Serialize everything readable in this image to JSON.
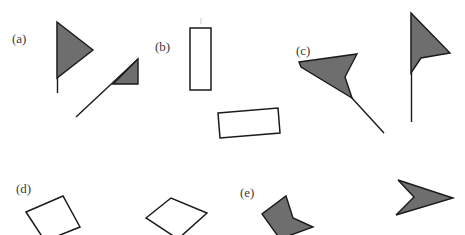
{
  "figure": {
    "background_color": "#ffffff",
    "fill_color": "#6e6e6e",
    "stroke_color": "#1a1a1a",
    "label_color": "#3b3b3b",
    "width": 465,
    "height": 235
  },
  "panels": [
    {
      "id": "a",
      "label": "(a)",
      "label_x": 12,
      "label_y": 32,
      "shapes": [
        {
          "name": "flag-with-triangle-pennant",
          "type": "filled-polygon-with-pole",
          "points": "57,22 93,50 57,78",
          "pole": "57,22 57,93"
        },
        {
          "name": "diagonal-line-with-right-triangle",
          "type": "filled-polygon-with-line",
          "points": "113,84 138,84 138,59",
          "line": "76,117 138,59"
        }
      ]
    },
    {
      "id": "b",
      "label": "(b)",
      "label_x": 155,
      "label_y": 40,
      "shapes": [
        {
          "name": "vertical-rectangle-outline",
          "type": "outline-polygon",
          "points": "190,28 211,28 211,90 190,90"
        },
        {
          "name": "tilted-rectangle-outline",
          "type": "outline-polygon",
          "points": "218,113 278,108 280,133 220,138"
        },
        {
          "name": "faint-tick-mark",
          "type": "faint-line",
          "line": "201,18 201,24"
        }
      ]
    },
    {
      "id": "c",
      "label": "(c)",
      "label_x": 296,
      "label_y": 44,
      "shapes": [
        {
          "name": "concave-dart-with-tail-line",
          "type": "filled-polygon-with-line",
          "points": "299,62 356,55 347,76 352,96 303,68",
          "alt_points": "299,62 357,54 345,77 351,98 301,66",
          "line": "351,98 383,132"
        },
        {
          "name": "flag-with-concave-dart-pennant",
          "type": "filled-polygon-with-pole",
          "points": "411,13 449,53 421,58 411,72",
          "pole": "411,13 411,122"
        }
      ]
    },
    {
      "id": "d",
      "label": "(d)",
      "label_x": 16,
      "label_y": 182,
      "shapes": [
        {
          "name": "left-quadrilateral-outline",
          "type": "outline-polygon",
          "points": "26,212 63,196 80,227 45,240"
        },
        {
          "name": "right-quadrilateral-outline",
          "type": "outline-polygon",
          "points": "146,218 171,198 207,213 178,238"
        }
      ]
    },
    {
      "id": "e",
      "label": "(e)",
      "label_x": 240,
      "label_y": 186,
      "shapes": [
        {
          "name": "left-concave-dart",
          "type": "filled-polygon",
          "points": "286,196 293,218 312,226 281,238 262,214"
        },
        {
          "name": "right-concave-dart",
          "type": "filled-polygon",
          "points": "398,180 452,198 397,214 413,197"
        }
      ]
    }
  ]
}
